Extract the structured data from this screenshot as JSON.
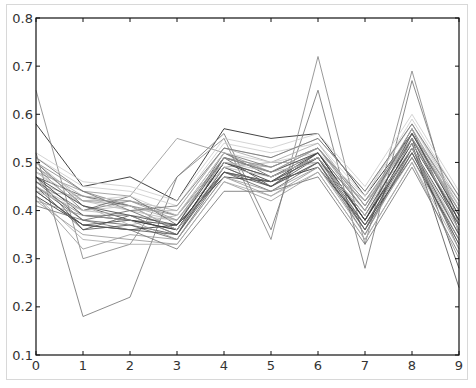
{
  "chart_data": {
    "type": "line",
    "title": "",
    "xlabel": "",
    "ylabel": "",
    "x": [
      0,
      1,
      2,
      3,
      4,
      5,
      6,
      7,
      8,
      9
    ],
    "xlim": [
      0,
      9
    ],
    "ylim": [
      0.1,
      0.8
    ],
    "xticks": [
      "0",
      "1",
      "2",
      "3",
      "4",
      "5",
      "6",
      "7",
      "8",
      "9"
    ],
    "yticks": [
      "0.1",
      "0.2",
      "0.3",
      "0.4",
      "0.5",
      "0.6",
      "0.7",
      "0.8"
    ],
    "grid": false,
    "legend": null,
    "series": [
      {
        "name": "s1",
        "color": "#222222",
        "values": [
          0.58,
          0.45,
          0.47,
          0.42,
          0.57,
          0.55,
          0.56,
          0.43,
          0.56,
          0.4
        ]
      },
      {
        "name": "s2",
        "color": "#888888",
        "values": [
          0.65,
          0.3,
          0.33,
          0.47,
          0.55,
          0.34,
          0.72,
          0.33,
          0.69,
          0.35
        ]
      },
      {
        "name": "s3",
        "color": "#777777",
        "values": [
          0.52,
          0.18,
          0.22,
          0.47,
          0.56,
          0.36,
          0.65,
          0.28,
          0.67,
          0.37
        ]
      },
      {
        "name": "s4",
        "color": "#444444",
        "values": [
          0.5,
          0.41,
          0.38,
          0.36,
          0.5,
          0.47,
          0.51,
          0.36,
          0.55,
          0.28
        ]
      },
      {
        "name": "s5",
        "color": "#999999",
        "values": [
          0.48,
          0.44,
          0.43,
          0.55,
          0.52,
          0.48,
          0.53,
          0.4,
          0.57,
          0.41
        ]
      },
      {
        "name": "s6",
        "color": "#555555",
        "values": [
          0.47,
          0.36,
          0.39,
          0.35,
          0.51,
          0.45,
          0.52,
          0.38,
          0.54,
          0.24
        ]
      },
      {
        "name": "s7",
        "color": "#aaaaaa",
        "values": [
          0.46,
          0.42,
          0.41,
          0.38,
          0.49,
          0.5,
          0.5,
          0.42,
          0.52,
          0.36
        ]
      },
      {
        "name": "s8",
        "color": "#666666",
        "values": [
          0.45,
          0.38,
          0.37,
          0.34,
          0.48,
          0.44,
          0.5,
          0.35,
          0.53,
          0.32
        ]
      },
      {
        "name": "s9",
        "color": "#bbbbbb",
        "values": [
          0.44,
          0.43,
          0.4,
          0.4,
          0.53,
          0.51,
          0.55,
          0.44,
          0.58,
          0.42
        ]
      },
      {
        "name": "s10",
        "color": "#333333",
        "values": [
          0.43,
          0.37,
          0.36,
          0.37,
          0.47,
          0.46,
          0.49,
          0.37,
          0.51,
          0.34
        ]
      },
      {
        "name": "s11",
        "color": "#777777",
        "values": [
          0.49,
          0.4,
          0.42,
          0.39,
          0.52,
          0.49,
          0.53,
          0.41,
          0.56,
          0.39
        ]
      },
      {
        "name": "s12",
        "color": "#999999",
        "values": [
          0.42,
          0.35,
          0.34,
          0.33,
          0.46,
          0.42,
          0.48,
          0.34,
          0.5,
          0.3
        ]
      },
      {
        "name": "s13",
        "color": "#cccccc",
        "values": [
          0.51,
          0.45,
          0.44,
          0.41,
          0.54,
          0.52,
          0.54,
          0.43,
          0.59,
          0.43
        ]
      },
      {
        "name": "s14",
        "color": "#555555",
        "values": [
          0.47,
          0.43,
          0.41,
          0.36,
          0.5,
          0.47,
          0.51,
          0.39,
          0.55,
          0.38
        ]
      },
      {
        "name": "s15",
        "color": "#888888",
        "values": [
          0.45,
          0.39,
          0.39,
          0.35,
          0.49,
          0.45,
          0.5,
          0.37,
          0.52,
          0.35
        ]
      },
      {
        "name": "s16",
        "color": "#bbbbbb",
        "values": [
          0.5,
          0.42,
          0.4,
          0.38,
          0.51,
          0.48,
          0.52,
          0.4,
          0.56,
          0.4
        ]
      },
      {
        "name": "s17",
        "color": "#444444",
        "values": [
          0.44,
          0.37,
          0.38,
          0.37,
          0.48,
          0.46,
          0.51,
          0.38,
          0.53,
          0.37
        ]
      },
      {
        "name": "s18",
        "color": "#aaaaaa",
        "values": [
          0.48,
          0.41,
          0.37,
          0.39,
          0.5,
          0.49,
          0.53,
          0.42,
          0.55,
          0.41
        ]
      },
      {
        "name": "s19",
        "color": "#666666",
        "values": [
          0.46,
          0.4,
          0.43,
          0.37,
          0.52,
          0.47,
          0.52,
          0.4,
          0.57,
          0.36
        ]
      },
      {
        "name": "s20",
        "color": "#999999",
        "values": [
          0.43,
          0.32,
          0.35,
          0.34,
          0.47,
          0.43,
          0.49,
          0.36,
          0.51,
          0.33
        ]
      },
      {
        "name": "s21",
        "color": "#cccccc",
        "values": [
          0.52,
          0.46,
          0.45,
          0.42,
          0.55,
          0.53,
          0.56,
          0.45,
          0.6,
          0.44
        ]
      },
      {
        "name": "s22",
        "color": "#333333",
        "values": [
          0.47,
          0.39,
          0.38,
          0.36,
          0.5,
          0.46,
          0.52,
          0.38,
          0.54,
          0.38
        ]
      },
      {
        "name": "s23",
        "color": "#777777",
        "values": [
          0.41,
          0.38,
          0.36,
          0.32,
          0.44,
          0.44,
          0.47,
          0.33,
          0.49,
          0.31
        ]
      },
      {
        "name": "s24",
        "color": "#aaaaaa",
        "values": [
          0.49,
          0.43,
          0.42,
          0.4,
          0.53,
          0.5,
          0.54,
          0.41,
          0.57,
          0.4
        ]
      },
      {
        "name": "s25",
        "color": "#555555",
        "values": [
          0.45,
          0.36,
          0.37,
          0.35,
          0.49,
          0.45,
          0.51,
          0.37,
          0.53,
          0.35
        ]
      },
      {
        "name": "s26",
        "color": "#bbbbbb",
        "values": [
          0.44,
          0.4,
          0.39,
          0.38,
          0.5,
          0.48,
          0.5,
          0.4,
          0.54,
          0.39
        ]
      },
      {
        "name": "s27",
        "color": "#888888",
        "values": [
          0.5,
          0.44,
          0.41,
          0.39,
          0.51,
          0.49,
          0.53,
          0.42,
          0.56,
          0.42
        ]
      },
      {
        "name": "s28",
        "color": "#666666",
        "values": [
          0.46,
          0.38,
          0.4,
          0.36,
          0.48,
          0.46,
          0.51,
          0.39,
          0.55,
          0.37
        ]
      },
      {
        "name": "s29",
        "color": "#999999",
        "values": [
          0.42,
          0.39,
          0.38,
          0.34,
          0.47,
          0.44,
          0.49,
          0.35,
          0.52,
          0.34
        ]
      },
      {
        "name": "s30",
        "color": "#cccccc",
        "values": [
          0.48,
          0.42,
          0.43,
          0.39,
          0.52,
          0.5,
          0.52,
          0.43,
          0.58,
          0.41
        ]
      },
      {
        "name": "s31",
        "color": "#444444",
        "values": [
          0.47,
          0.41,
          0.39,
          0.37,
          0.51,
          0.48,
          0.52,
          0.38,
          0.56,
          0.39
        ]
      },
      {
        "name": "s32",
        "color": "#aaaaaa",
        "values": [
          0.43,
          0.34,
          0.33,
          0.33,
          0.46,
          0.43,
          0.48,
          0.34,
          0.5,
          0.32
        ]
      },
      {
        "name": "s33",
        "color": "#777777",
        "values": [
          0.51,
          0.44,
          0.4,
          0.41,
          0.53,
          0.51,
          0.55,
          0.44,
          0.58,
          0.43
        ]
      },
      {
        "name": "s34",
        "color": "#bbbbbb",
        "values": [
          0.45,
          0.4,
          0.41,
          0.36,
          0.49,
          0.47,
          0.51,
          0.39,
          0.53,
          0.36
        ]
      },
      {
        "name": "s35",
        "color": "#555555",
        "values": [
          0.44,
          0.37,
          0.36,
          0.35,
          0.48,
          0.45,
          0.5,
          0.36,
          0.52,
          0.33
        ]
      },
      {
        "name": "s36",
        "color": "#999999",
        "values": [
          0.49,
          0.42,
          0.42,
          0.38,
          0.51,
          0.48,
          0.53,
          0.41,
          0.55,
          0.4
        ]
      }
    ]
  }
}
